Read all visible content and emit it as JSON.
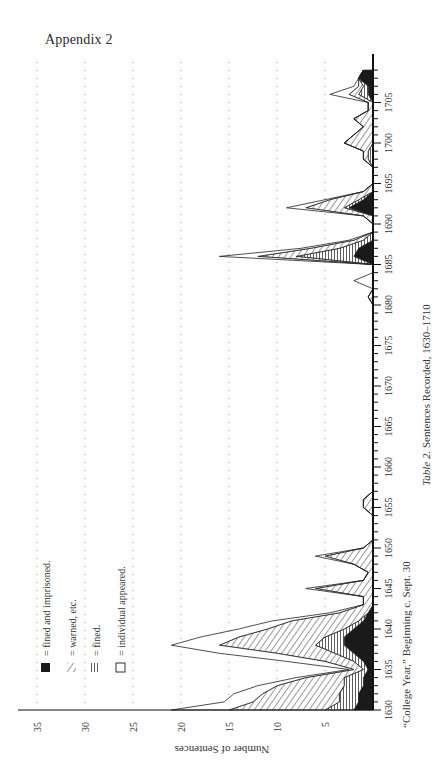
{
  "page": {
    "header": "Appendix 2",
    "caption_prefix": "Table 2.",
    "caption_text": "Sentences Recorded, 1630–1710",
    "x_axis_note": "“College Year,” Beginning c. Sept. 30"
  },
  "legend": [
    {
      "symbol": "solid",
      "label": "= fined and imprisoned."
    },
    {
      "symbol": "diagonal",
      "label": "= warned, etc."
    },
    {
      "symbol": "horizontal",
      "label": "= fined."
    },
    {
      "symbol": "open",
      "label": "= individual appeared."
    }
  ],
  "chart_data": {
    "type": "area",
    "orientation": "rotated 90° counterclockwise (years run bottom-to-top, counts run right-to-left)",
    "title": "Table 2. Sentences Recorded, 1630–1710",
    "xlabel": "“College Year,” Beginning c. Sept. 30",
    "ylabel": "Number of Sentences",
    "x_ticks": [
      1630,
      1635,
      1640,
      1645,
      1650,
      1655,
      1660,
      1665,
      1670,
      1675,
      1680,
      1685,
      1690,
      1695,
      1700,
      1705
    ],
    "y_ticks": [
      5,
      10,
      15,
      20,
      25,
      30,
      35
    ],
    "ylim": [
      0,
      37
    ],
    "xlim": [
      1630,
      1710
    ],
    "grid": "dotted lines at each 5 sentences",
    "legend_position": "upper-left of rotated figure",
    "x": [
      1630,
      1631,
      1632,
      1633,
      1634,
      1635,
      1636,
      1637,
      1638,
      1639,
      1640,
      1641,
      1642,
      1643,
      1644,
      1645,
      1646,
      1647,
      1648,
      1649,
      1650,
      1651,
      1652,
      1653,
      1654,
      1655,
      1656,
      1657,
      1658,
      1659,
      1660,
      1661,
      1662,
      1663,
      1664,
      1665,
      1666,
      1667,
      1668,
      1669,
      1670,
      1671,
      1672,
      1673,
      1674,
      1675,
      1676,
      1677,
      1678,
      1679,
      1680,
      1681,
      1682,
      1683,
      1684,
      1685,
      1686,
      1687,
      1688,
      1689,
      1690,
      1691,
      1692,
      1693,
      1694,
      1695,
      1696,
      1697,
      1698,
      1699,
      1700,
      1701,
      1702,
      1703,
      1704,
      1705,
      1706,
      1707,
      1708,
      1709
    ],
    "series": [
      {
        "name": "fined and imprisoned",
        "pattern": "solid",
        "values": [
          2,
          1.5,
          1.5,
          1,
          1,
          0.5,
          1,
          2,
          3,
          3,
          2,
          1,
          0.5,
          0,
          0,
          0,
          0,
          0,
          0,
          0,
          0,
          0,
          0,
          0,
          0,
          0,
          0,
          0,
          0,
          0,
          0,
          0,
          0,
          0,
          0,
          0,
          0,
          0,
          0,
          0,
          0,
          0,
          0,
          0,
          0,
          0,
          0,
          0,
          0,
          0,
          0,
          0,
          0,
          0,
          0,
          0,
          2,
          1.5,
          0,
          0,
          0,
          0,
          2.5,
          1,
          0,
          0,
          0,
          0,
          0,
          0,
          0,
          0,
          0,
          0,
          0,
          0,
          0.5,
          0.5,
          1.5,
          1
        ]
      },
      {
        "name": "warned, etc.",
        "pattern": "diagonal",
        "values": [
          10,
          9,
          8,
          7,
          4,
          1,
          3,
          6,
          10,
          9,
          8,
          7,
          3,
          1,
          1,
          6,
          1,
          0.5,
          2,
          5,
          1,
          0,
          0,
          0,
          0,
          1,
          1,
          0,
          0,
          0,
          0,
          0,
          0,
          0,
          0,
          0,
          0,
          0,
          0,
          0,
          0,
          0,
          0,
          0,
          0,
          0,
          0,
          0,
          0,
          0,
          0,
          0.5,
          0,
          0,
          0,
          0,
          4,
          3,
          1,
          0,
          0,
          1,
          4,
          3,
          1,
          0,
          0,
          0,
          0.5,
          0.5,
          3,
          2,
          1,
          2,
          0.5,
          0.5,
          1,
          0.5,
          0,
          0
        ]
      },
      {
        "name": "fined",
        "pattern": "horizontal",
        "values": [
          3,
          2,
          2,
          2,
          2,
          0.5,
          1,
          2,
          3,
          2,
          1,
          0.5,
          0,
          0,
          0,
          0,
          0,
          0,
          0,
          0,
          0,
          0,
          0,
          0,
          0,
          0,
          0,
          0,
          0,
          0,
          0,
          0,
          0,
          0,
          0,
          0,
          0,
          0,
          0,
          0,
          0,
          0,
          0,
          0,
          0,
          0,
          0,
          0,
          0,
          0,
          0,
          0,
          0,
          0,
          0,
          0,
          6,
          2,
          1,
          0,
          0,
          0,
          0.5,
          0.5,
          0,
          0,
          0,
          0,
          0.5,
          0.5,
          0,
          0,
          0,
          0,
          0,
          0,
          1,
          0.5,
          0,
          0
        ]
      },
      {
        "name": "individual appeared",
        "pattern": "open",
        "values": [
          6,
          3,
          3,
          2,
          1,
          0.5,
          4,
          6,
          5,
          4,
          3,
          2,
          1,
          0,
          0,
          1,
          0,
          0,
          0,
          1,
          0,
          0,
          0,
          0,
          0,
          0,
          0,
          0,
          0,
          0,
          0,
          0,
          0,
          0,
          0,
          0,
          0,
          0,
          0,
          0,
          0,
          0,
          0,
          0,
          0,
          0,
          0,
          0,
          0,
          0,
          0,
          0,
          0,
          2,
          0,
          0,
          4,
          1,
          0.5,
          0,
          0,
          0,
          2,
          0.5,
          0,
          0,
          0,
          0,
          0,
          0,
          0,
          0,
          0,
          0,
          0,
          0,
          2,
          0.5,
          0,
          0
        ]
      }
    ],
    "totals": [
      21,
      15.5,
      14.5,
      12,
      8,
      2.5,
      9,
      16,
      21,
      18,
      14,
      10.5,
      4.5,
      1,
      1,
      7,
      1,
      0.5,
      2,
      6,
      1,
      0,
      0,
      0,
      0,
      1,
      1,
      0,
      0,
      0,
      0,
      0,
      0,
      0,
      0,
      0,
      0,
      0,
      0,
      0,
      0,
      0,
      0,
      0,
      0,
      0,
      0,
      0,
      0,
      0,
      0,
      0.5,
      0,
      2,
      0,
      0,
      16,
      7.5,
      2.5,
      0,
      0,
      1,
      9,
      5,
      1,
      0,
      0,
      0,
      1,
      1,
      3,
      2,
      1,
      2,
      0.5,
      0.5,
      4.5,
      2,
      1.5,
      1
    ]
  }
}
